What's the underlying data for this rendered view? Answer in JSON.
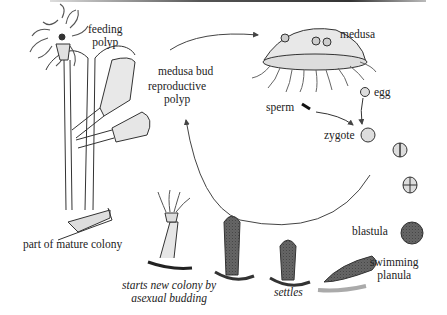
{
  "diagram": {
    "labels": {
      "feeding_polyp": [
        "feeding",
        "polyp"
      ],
      "medusa_bud": "medusa bud",
      "reproductive_polyp": [
        "reproductive",
        "polyp"
      ],
      "medusa": "medusa",
      "egg": "egg",
      "sperm": "sperm",
      "zygote": "zygote",
      "blastula": "blastula",
      "swimming_planula": [
        "swimming",
        "planula"
      ],
      "settles": "settles",
      "starts_new_colony": [
        "starts new colony by",
        "asexual budding"
      ],
      "part_of_mature_colony": "part of mature colony"
    },
    "colors": {
      "ink": "#333333",
      "fill": "#e6e6e6",
      "shadow": "#222222"
    }
  }
}
